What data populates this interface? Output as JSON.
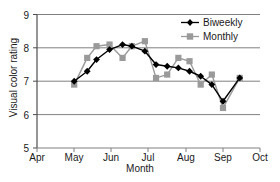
{
  "chart_data": {
    "type": "line",
    "title": "",
    "xlabel": "Month",
    "ylabel": "Visual color rating",
    "ylim": [
      5,
      9
    ],
    "yticks": [
      5,
      6,
      7,
      8,
      9
    ],
    "xticks": [
      "Apr",
      "May",
      "Jun",
      "Jul",
      "Aug",
      "Sep",
      "Oct"
    ],
    "grid": "horizontal",
    "legend_position": "top-right",
    "series": [
      {
        "name": "Biweekly",
        "color": "#000000",
        "marker": "diamond",
        "x": [
          "May",
          "May+0.5",
          "Jun-0.5",
          "Jun",
          "Jun+0.5",
          "Jul-0.5",
          "Jul",
          "Jul+0.5",
          "Aug-0.5",
          "Aug",
          "Aug+0.5",
          "Sep-0.5",
          "Sep",
          "Sep+0.5",
          "Oct-0.3"
        ],
        "x_values": [
          5.0,
          5.35,
          5.6,
          5.95,
          6.3,
          6.55,
          6.9,
          7.2,
          7.5,
          7.8,
          8.1,
          8.4,
          8.7,
          9.0,
          9.45
        ],
        "values": [
          7.0,
          7.3,
          7.65,
          7.95,
          8.1,
          8.05,
          7.9,
          7.5,
          7.45,
          7.4,
          7.3,
          7.15,
          6.9,
          6.4,
          7.1
        ]
      },
      {
        "name": "Monthly",
        "color": "#9a9a9a",
        "marker": "square",
        "x": [
          "May",
          "May+0.5",
          "Jun-0.5",
          "Jun",
          "Jun+0.5",
          "Jul-0.5",
          "Jul",
          "Jul+0.5",
          "Aug-0.5",
          "Aug",
          "Aug+0.5",
          "Sep-0.5",
          "Sep",
          "Sep+0.5",
          "Oct-0.3"
        ],
        "x_values": [
          5.0,
          5.35,
          5.6,
          5.95,
          6.3,
          6.55,
          6.9,
          7.2,
          7.5,
          7.8,
          8.1,
          8.4,
          8.7,
          9.0,
          9.45
        ],
        "values": [
          6.9,
          7.7,
          8.05,
          8.1,
          7.7,
          8.05,
          8.2,
          7.1,
          7.2,
          7.7,
          7.6,
          6.9,
          7.2,
          6.2,
          7.1
        ]
      }
    ],
    "colors": {
      "biweekly": "#000000",
      "monthly": "#9a9a9a",
      "gridline": "#808080",
      "axis": "#4d4d4d",
      "text": "#1a1a1a",
      "background": "#ffffff"
    }
  },
  "legend": {
    "items": [
      {
        "label": "Biweekly"
      },
      {
        "label": "Monthly"
      }
    ]
  }
}
